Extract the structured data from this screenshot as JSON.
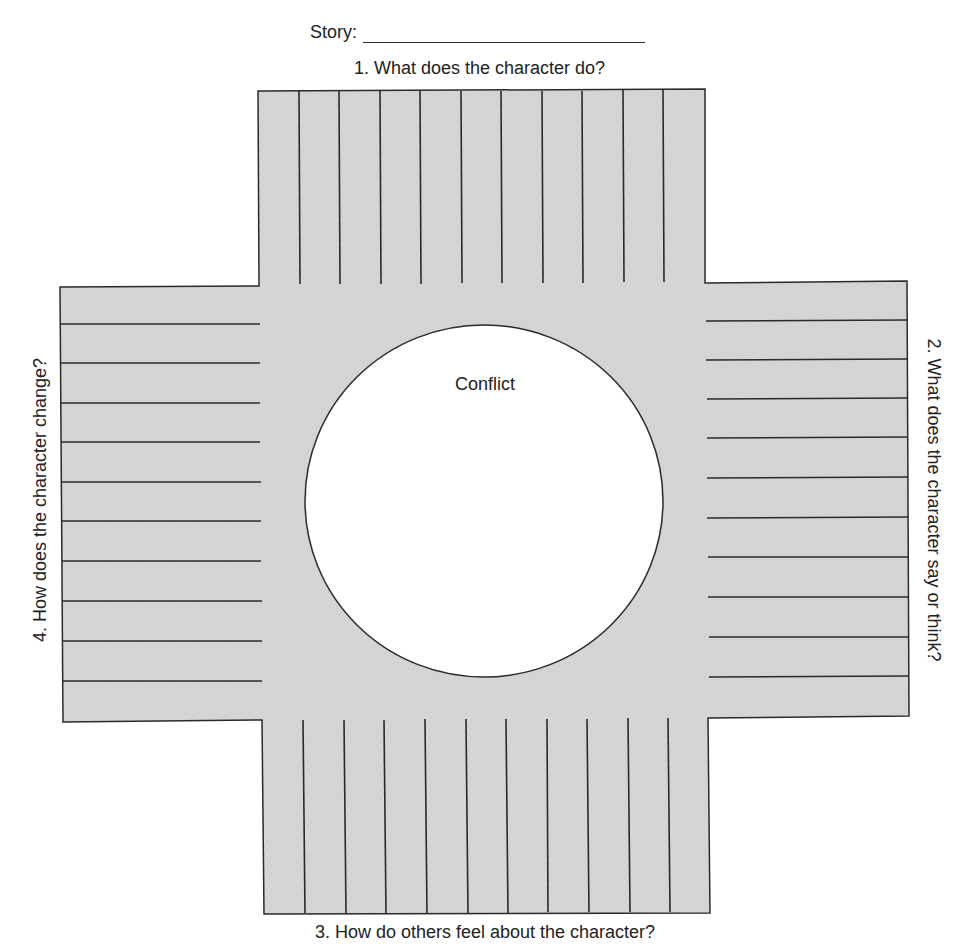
{
  "header": {
    "story_label": "Story:"
  },
  "diagram": {
    "center_label": "Conflict",
    "questions": {
      "top": "1. What does the character do?",
      "right": "2. What does the character say or think?",
      "bottom": "3. How do others feel about the character?",
      "left": "4. How does the character change?"
    },
    "colors": {
      "fill": "#d4d4d4",
      "stroke": "#2a2a2a",
      "circle": "#ffffff"
    },
    "line_counts": {
      "top": 10,
      "right": 10,
      "bottom": 10,
      "left": 10
    }
  }
}
